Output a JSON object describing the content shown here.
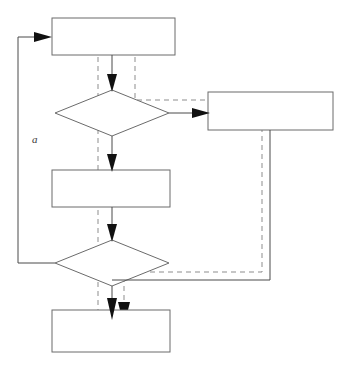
{
  "diagram": {
    "type": "flowchart",
    "title": "",
    "canvas": {
      "width": 344,
      "height": 365,
      "background": "#ffffff"
    },
    "colors": {
      "node_stroke": "#6b6b6b",
      "node_fill": "#ffffff",
      "solid_edge": "#4a4a4a",
      "dashed_edge": "#8d8d8d",
      "arrowhead": "#111111",
      "label_text": "#3a3a3a"
    },
    "nodes": [
      {
        "id": "process-top",
        "shape": "rectangle",
        "label": "",
        "x": 52,
        "y": 18,
        "w": 123,
        "h": 37
      },
      {
        "id": "decision-first",
        "shape": "diamond",
        "label": "",
        "cx": 112,
        "cy": 113,
        "rx": 57,
        "ry": 23
      },
      {
        "id": "process-right",
        "shape": "rectangle",
        "label": "",
        "x": 208,
        "y": 92,
        "w": 125,
        "h": 38
      },
      {
        "id": "process-middle",
        "shape": "rectangle",
        "label": "",
        "x": 52,
        "y": 170,
        "w": 118,
        "h": 37
      },
      {
        "id": "decision-second",
        "shape": "diamond",
        "label": "",
        "cx": 112,
        "cy": 263,
        "rx": 57,
        "ry": 23
      },
      {
        "id": "process-bottom",
        "shape": "rectangle",
        "label": "",
        "x": 52,
        "y": 310,
        "w": 118,
        "h": 42
      }
    ],
    "edges": [
      {
        "id": "edge-top-to-decision1",
        "style": "solid",
        "from": "process-top",
        "to": "decision-first",
        "label": ""
      },
      {
        "id": "edge-decision1-to-right",
        "style": "solid",
        "from": "decision-first",
        "to": "process-right",
        "label": ""
      },
      {
        "id": "edge-decision1-to-middle",
        "style": "solid",
        "from": "decision-first",
        "to": "process-middle",
        "label": ""
      },
      {
        "id": "edge-middle-to-decision2",
        "style": "solid",
        "from": "process-middle",
        "to": "decision-second",
        "label": ""
      },
      {
        "id": "edge-decision2-to-bottom",
        "style": "solid",
        "from": "decision-second",
        "to": "process-bottom",
        "label": ""
      },
      {
        "id": "edge-decision2-feedback",
        "style": "solid",
        "from": "decision-second",
        "to": "process-top",
        "label": "a"
      },
      {
        "id": "edge-right-return-to-bottom",
        "style": "solid",
        "from": "process-right",
        "to": "process-bottom",
        "label": ""
      },
      {
        "id": "edge-dashed-left-spine",
        "style": "dashed",
        "from": "process-top",
        "to": "process-bottom",
        "label": ""
      },
      {
        "id": "edge-dashed-top-to-right",
        "style": "dashed",
        "from": "process-top",
        "to": "process-right",
        "label": ""
      },
      {
        "id": "edge-dashed-right-return",
        "style": "dashed",
        "from": "process-right",
        "to": "process-bottom",
        "label": ""
      }
    ],
    "labels": [
      {
        "id": "feedback-label-a",
        "text": "a",
        "x": 32,
        "y": 143
      }
    ]
  }
}
